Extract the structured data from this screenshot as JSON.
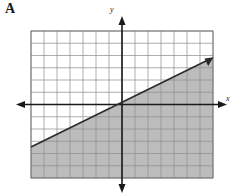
{
  "figure": {
    "part_label": "A",
    "type": "linear-inequality-graph"
  },
  "axes": {
    "x_label": "x",
    "y_label": "y",
    "x_min": -7,
    "x_max": 7,
    "y_min": -6,
    "y_max": 6,
    "grid_step": 1,
    "grid_visible": true,
    "arrow_heads": [
      "left",
      "right",
      "up",
      "down"
    ]
  },
  "graph": {
    "line": {
      "style": "solid",
      "slope": 0.5,
      "y_intercept": 1,
      "equation": "y = (1/2)x + 1",
      "point_a": {
        "x": -7,
        "y": -2.5
      },
      "point_b": {
        "x": 7,
        "y": 4.5
      },
      "arrow_head_end": "up-right"
    },
    "shading": {
      "region": "below",
      "inequality": "y <= (1/2)x + 1"
    }
  },
  "colors": {
    "background": "#ffffff",
    "grid_line": "#8c8c8c",
    "grid_border": "#6e6e6e",
    "axis": "#1a1a1a",
    "line": "#2b2b2b",
    "shade_fill": "#b8b8b8",
    "label_text": "#1a1a1a"
  },
  "geometry": {
    "plot_left": 31,
    "plot_top": 31,
    "plot_right": 213,
    "plot_bottom": 178,
    "cell_width": 13,
    "cell_height": 12.25,
    "origin_x": 122,
    "origin_y": 104.5
  }
}
